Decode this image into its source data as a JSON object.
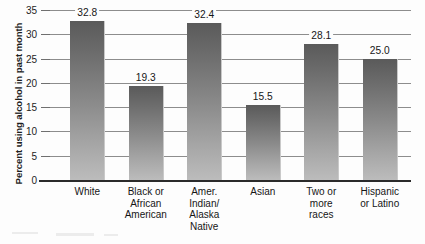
{
  "chart_data": {
    "type": "bar",
    "title": "",
    "xlabel": "",
    "ylabel": "Percent using alcohol in past month",
    "ylim": [
      0,
      35
    ],
    "ytick_labels": [
      "0",
      "5",
      "10",
      "15",
      "20",
      "25",
      "30",
      "35"
    ],
    "yticks": [
      0,
      5,
      10,
      15,
      20,
      25,
      30,
      35
    ],
    "grid": true,
    "legend": false,
    "categories": [
      "White",
      "Black or African American",
      "Amer. Indian/ Alaska Native",
      "Asian",
      "Two or more races",
      "Hispanic or Latino"
    ],
    "category_lines": [
      [
        "White"
      ],
      [
        "Black or",
        "African",
        "American"
      ],
      [
        "Amer.",
        "Indian/",
        "Alaska",
        "Native"
      ],
      [
        "Asian"
      ],
      [
        "Two or",
        "more",
        "races"
      ],
      [
        "Hispanic",
        "or Latino"
      ]
    ],
    "values": [
      32.8,
      19.3,
      32.4,
      15.5,
      28.1,
      25.0
    ],
    "value_labels": [
      "32.8",
      "19.3",
      "32.4",
      "15.5",
      "28.1",
      "25.0"
    ],
    "colors": {
      "bar_top": "#5a5a5a",
      "bar_bottom": "#bcbcbc",
      "gridline": "#8d8d8d",
      "axis": "#2b2b2b",
      "text": "#161616",
      "background": "#fdfdfd"
    }
  }
}
